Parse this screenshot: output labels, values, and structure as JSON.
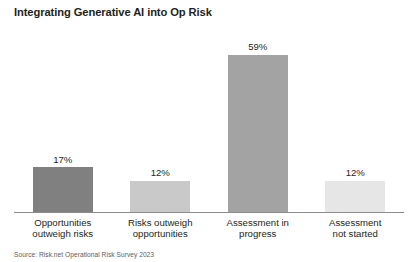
{
  "chart_data": {
    "type": "bar",
    "title": "Integrating Generative AI into Op Risk",
    "xlabel": "",
    "ylabel": "",
    "ylim": [
      0,
      69
    ],
    "grid": false,
    "legend": "none",
    "axis_visible": "x-only",
    "value_label_suffix": "%",
    "categories": [
      "Opportunities outweigh risks",
      "Risks outweigh opportunities",
      "Assessment in progress",
      "Assessment not started"
    ],
    "category_lines": [
      [
        "Opportunities",
        "outweigh risks"
      ],
      [
        "Risks outweigh",
        "opportunities"
      ],
      [
        "Assessment in",
        "progress"
      ],
      [
        "Assessment",
        "not started"
      ]
    ],
    "values": [
      17,
      12,
      59,
      12
    ],
    "value_labels": [
      "17%",
      "12%",
      "59%",
      "12%"
    ],
    "bar_colors": [
      "#808080",
      "#c9c9c9",
      "#a3a3a3",
      "#e6e6e6"
    ]
  },
  "source": {
    "note": "Source: Risk.net Operational Risk Survey 2023"
  },
  "colors": {
    "text": "#231f20",
    "axis": "#8c8c8c",
    "background": "#ffffff",
    "source_text": "#5d5d5d"
  }
}
